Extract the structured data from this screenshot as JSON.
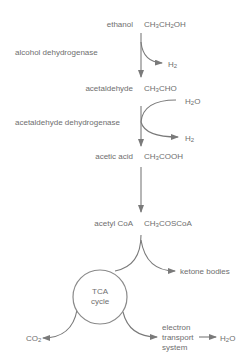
{
  "diagram": {
    "compounds": [
      {
        "name": "ethanol",
        "formula_parts": [
          "CH",
          "3",
          "CH",
          "2",
          "OH"
        ]
      },
      {
        "name": "acetaldehyde",
        "formula_parts": [
          "CH",
          "3",
          "CHO"
        ]
      },
      {
        "name": "acetic acid",
        "formula_parts": [
          "CH",
          "3",
          "COOH"
        ]
      },
      {
        "name": "acetyl CoA",
        "formula_parts": [
          "CH",
          "3",
          "COSCoA"
        ]
      }
    ],
    "enzymes": [
      {
        "name": "alcohol dehydrogenase"
      },
      {
        "name": "acetaldehyde dehydrogenase"
      }
    ],
    "byproducts": {
      "step1_out": {
        "base": "H",
        "sub": "2"
      },
      "step2_in": {
        "base": "H",
        "sub": "2",
        "tail": "O"
      },
      "step2_out": {
        "base": "H",
        "sub": "2"
      }
    },
    "branches": {
      "ketone": "ketone bodies",
      "tca_line1": "TCA",
      "tca_line2": "cycle",
      "co2": {
        "base": "CO",
        "sub": "2"
      },
      "ets_line1": "electron",
      "ets_line2": "transport",
      "ets_line3": "system",
      "h2o_final": {
        "base": "H",
        "sub": "2",
        "tail": "O"
      }
    },
    "colors": {
      "line": "#7a7a7a",
      "text": "#6e6e6e",
      "circle": "#8a8a8a"
    }
  }
}
